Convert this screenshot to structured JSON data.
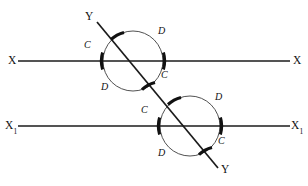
{
  "figure": {
    "background_color": "#ffffff",
    "ink_color": "#111111",
    "thin_arc_color": "#3d3d3d",
    "width": 308,
    "height": 186
  },
  "lines": {
    "upper_parallel": {
      "name": "X",
      "left_label": "X",
      "right_label": "X",
      "y": 61,
      "x_start": 18,
      "x_end": 290
    },
    "lower_parallel": {
      "name": "X1",
      "left_label": "X",
      "left_label_subscript": "1",
      "right_label": "X",
      "right_label_subscript": "1",
      "y": 126,
      "x_start": 18,
      "x_end": 290
    },
    "transversal": {
      "name": "Y",
      "start_label": "Y",
      "end_label": "Y",
      "x_start": 97,
      "y_start": 22,
      "x_end": 218,
      "y_end": 168
    }
  },
  "circles": [
    {
      "id": "upper-circle",
      "cx": 133,
      "cy": 61,
      "r": 30,
      "intersections": [
        {
          "label": "C",
          "position": "left-on-line"
        },
        {
          "label": "C",
          "position": "right-on-line"
        },
        {
          "label": "C",
          "position": "upper-left-on-transversal"
        },
        {
          "label": "C",
          "position": "lower-right-on-transversal"
        }
      ],
      "arc_labels": [
        {
          "label": "C",
          "x": 84,
          "y": 40
        },
        {
          "label": "D",
          "x": 158,
          "y": 26
        },
        {
          "label": "C",
          "x": 161,
          "y": 70
        },
        {
          "label": "D",
          "x": 101,
          "y": 82
        }
      ]
    },
    {
      "id": "lower-circle",
      "cx": 190,
      "cy": 126,
      "r": 30,
      "intersections": [
        {
          "label": "C",
          "position": "left-on-line"
        },
        {
          "label": "C",
          "position": "right-on-line"
        },
        {
          "label": "C",
          "position": "upper-left-on-transversal"
        },
        {
          "label": "C",
          "position": "lower-right-on-transversal"
        }
      ],
      "arc_labels": [
        {
          "label": "C",
          "x": 141,
          "y": 105
        },
        {
          "label": "D",
          "x": 215,
          "y": 92
        },
        {
          "label": "C",
          "x": 218,
          "y": 136
        },
        {
          "label": "D",
          "x": 158,
          "y": 148
        }
      ]
    }
  ],
  "endpoint_labels": {
    "transversal_top": "Y",
    "transversal_bottom": "Y",
    "upper_left": "X",
    "upper_right": "X",
    "lower_left": "X",
    "lower_left_sub": "1",
    "lower_right": "X",
    "lower_right_sub": "1"
  }
}
